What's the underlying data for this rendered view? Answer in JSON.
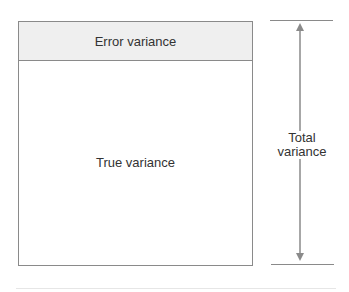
{
  "diagram": {
    "type": "variance-decomposition",
    "box": {
      "error_label": "Error variance",
      "true_label": "True variance"
    },
    "measure": {
      "label_line1": "Total",
      "label_line2": "variance"
    },
    "colors": {
      "line": "#8a8a8a",
      "error_fill": "#efefef",
      "text": "#333333"
    }
  }
}
